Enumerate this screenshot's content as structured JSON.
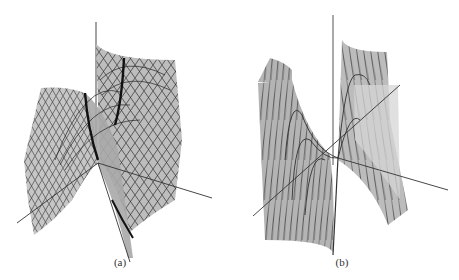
{
  "figure": {
    "panels": [
      {
        "id": "a",
        "caption": "(a)",
        "description": "3D wireframe surface with saddle-like fold, two thick dark ridge curves, axes crossing at center"
      },
      {
        "id": "b",
        "caption": "(b)",
        "description": "3D wireframe surface with cubic-like fold, vertical sheets, nested parabolic contour curves, axes crossing at center"
      }
    ],
    "colors": {
      "surface_fill": "#b8b8b8",
      "surface_light": "#d4d4d4",
      "mesh_line": "#2a2a2a",
      "axis_line": "#333333",
      "ridge_line": "#111111",
      "background": "#ffffff"
    }
  }
}
